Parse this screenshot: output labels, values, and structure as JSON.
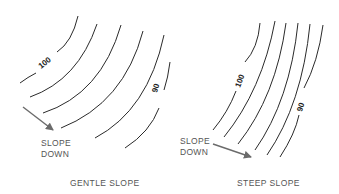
{
  "panels": [
    {
      "id": "gentle",
      "caption": "GENTLE SLOPE",
      "arrow_label_line1": "SLOPE",
      "arrow_label_line2": "DOWN",
      "contour_labels": {
        "high": "100",
        "low": "90"
      },
      "contour_count": 6
    },
    {
      "id": "steep",
      "caption": "STEEP SLOPE",
      "arrow_label_line1": "SLOPE",
      "arrow_label_line2": "DOWN",
      "contour_labels": {
        "high": "100",
        "low": "90"
      },
      "contour_count": 6
    }
  ],
  "colors": {
    "line": "#2a2a2a",
    "arrow": "#6b6b6b",
    "text": "#555555"
  }
}
